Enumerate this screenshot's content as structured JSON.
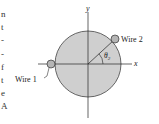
{
  "figure": {
    "axes": {
      "x_label": "x",
      "y_label": "y"
    },
    "conductor": {
      "fill": "#cfcfcf",
      "stroke": "#444444"
    },
    "wires": [
      {
        "label": "Wire 1",
        "position": "left, on x-axis"
      },
      {
        "label": "Wire 2",
        "position": "upper right, angle θ2 from x-axis"
      }
    ],
    "angle_label": "θ",
    "angle_subscript": "2"
  },
  "edge_text": [
    "n",
    "t",
    "-",
    "-",
    "f",
    "t",
    "e",
    "A"
  ]
}
